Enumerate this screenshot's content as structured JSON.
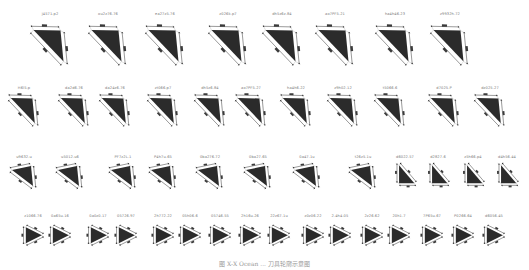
{
  "figure": {
    "caption": "图 X-X  Ocean ... 刀具轮廓示意图",
    "fill_color": "#2b2b2b",
    "line_color": "#555555"
  },
  "rows": [
    {
      "label_y": 14,
      "size": 30,
      "shape": "A",
      "items": [
        {
          "x": 50,
          "label": "j4571.p2"
        },
        {
          "x": 108,
          "label": "ou2z76.76"
        },
        {
          "x": 165,
          "label": "ea27z5.76"
        },
        {
          "x": 228,
          "label": "z026k.p7"
        },
        {
          "x": 282,
          "label": "dh5z6z.84"
        },
        {
          "x": 335,
          "label": "ao7PF5.21"
        },
        {
          "x": 395,
          "label": "ha4h46.23"
        },
        {
          "x": 450,
          "label": "z9932h.72"
        }
      ]
    },
    {
      "label_y": 88,
      "size": 24,
      "shape": "A",
      "items": [
        {
          "x": 24,
          "label": "H6l5.p"
        },
        {
          "x": 74,
          "label": "da2d6.76"
        },
        {
          "x": 115,
          "label": "da24z6.76"
        },
        {
          "x": 163,
          "label": "zt066.p7"
        },
        {
          "x": 210,
          "label": "dh5z6.84"
        },
        {
          "x": 251,
          "label": "ao7PF5.27"
        },
        {
          "x": 296,
          "label": "ha4h6.22"
        },
        {
          "x": 343,
          "label": "z9h02.12"
        },
        {
          "x": 390,
          "label": "t5066.6"
        },
        {
          "x": 444,
          "label": "d7025.P"
        },
        {
          "x": 490,
          "label": "dz025.27"
        }
      ]
    },
    {
      "label_y": 157,
      "size": 20,
      "shape": "B",
      "items": [
        {
          "x": 24,
          "label": "u9632.u"
        },
        {
          "x": 70,
          "label": "u5012.u6"
        },
        {
          "x": 123,
          "label": "PF7z2L.1"
        },
        {
          "x": 163,
          "label": "P4h7u.65"
        },
        {
          "x": 210,
          "label": "0ba276.72"
        },
        {
          "x": 258,
          "label": "0ba27.65"
        },
        {
          "x": 307,
          "label": "0a47.1u"
        },
        {
          "x": 363,
          "label": "t26z5.1u"
        },
        {
          "x": 405,
          "label": "d6022.57",
          "shape": "C"
        },
        {
          "x": 438,
          "label": "d2827.6",
          "shape": "C"
        },
        {
          "x": 473,
          "label": "z5h66.p4",
          "shape": "C"
        },
        {
          "x": 507,
          "label": "d4h56.44",
          "shape": "C"
        }
      ]
    },
    {
      "label_y": 216,
      "size": 16,
      "shape": "D",
      "items": [
        {
          "x": 33,
          "label": "z1066.76"
        },
        {
          "x": 60,
          "label": "0a65u.16"
        },
        {
          "x": 98,
          "label": "0a0z0.17"
        },
        {
          "x": 126,
          "label": "05726.97"
        },
        {
          "x": 163,
          "label": "2h772.22"
        },
        {
          "x": 190,
          "label": "05h06.6"
        },
        {
          "x": 220,
          "label": "05746.55"
        },
        {
          "x": 250,
          "label": "2h16u.26"
        },
        {
          "x": 279,
          "label": "22z67.1u"
        },
        {
          "x": 313,
          "label": "z0z06.22"
        },
        {
          "x": 340,
          "label": "2.4h4.05"
        },
        {
          "x": 372,
          "label": "2z26.62"
        },
        {
          "x": 399,
          "label": "20h1.7"
        },
        {
          "x": 432,
          "label": "7P65u.67"
        },
        {
          "x": 463,
          "label": "P0266.64"
        },
        {
          "x": 494,
          "label": "d6056.45"
        }
      ]
    }
  ]
}
